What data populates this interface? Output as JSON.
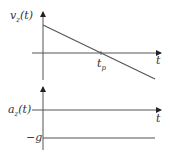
{
  "diagram": {
    "top_plot": {
      "y_label": "v_z(t)",
      "y_label_main": "v",
      "y_label_sub": "z",
      "y_label_arg": "(t)",
      "x_label": "t",
      "crossing_label_main": "t",
      "crossing_label_sub": "p",
      "description": "Linearly decreasing velocity crossing zero at t_p"
    },
    "bottom_plot": {
      "y_label_main": "a",
      "y_label_sub": "z",
      "y_label_arg": "(t)",
      "x_label": "t",
      "level_label": "−g",
      "description": "Constant acceleration equal to −g"
    },
    "colors": {
      "axis": "#222222",
      "line": "#555555",
      "text": "#333333"
    }
  }
}
